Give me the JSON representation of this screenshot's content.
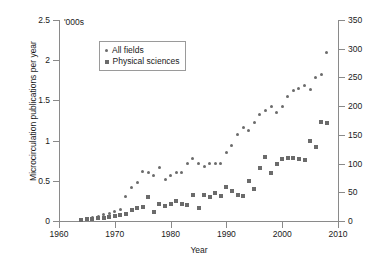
{
  "chart_data": {
    "type": "scatter",
    "title": "",
    "xlabel": "Year",
    "ylabel": "Microcirculation publications per year",
    "y_unit_note": "'000s",
    "xlim": [
      1960,
      2010
    ],
    "ylim_left": [
      0,
      2.5
    ],
    "ylim_right": [
      0,
      350
    ],
    "xticks": [
      1960,
      1970,
      1980,
      1990,
      2000,
      2010
    ],
    "yticks_left": [
      0,
      0.5,
      1,
      1.5,
      2,
      2.5
    ],
    "yticks_right": [
      0,
      50,
      100,
      150,
      200,
      250,
      300,
      350
    ],
    "grid": false,
    "legend_position": "upper-left-inside",
    "marker_color": "#6b6b6b",
    "axis_color": "#8a8a8a",
    "series": [
      {
        "name": "All fields",
        "marker": "circle",
        "axis": "left",
        "x": [
          1964,
          1965,
          1966,
          1967,
          1968,
          1969,
          1970,
          1971,
          1972,
          1973,
          1974,
          1975,
          1976,
          1977,
          1978,
          1979,
          1980,
          1981,
          1982,
          1983,
          1984,
          1985,
          1986,
          1987,
          1988,
          1989,
          1990,
          1991,
          1992,
          1993,
          1994,
          1995,
          1996,
          1997,
          1998,
          1999,
          2000,
          2001,
          2002,
          2003,
          2004,
          2005,
          2006,
          2007,
          2008
        ],
        "values": [
          0.02,
          0.03,
          0.04,
          0.06,
          0.08,
          0.09,
          0.12,
          0.14,
          0.3,
          0.42,
          0.48,
          0.62,
          0.6,
          0.56,
          0.67,
          0.52,
          0.57,
          0.6,
          0.6,
          0.72,
          0.78,
          0.72,
          0.68,
          0.72,
          0.71,
          0.72,
          0.85,
          0.94,
          1.08,
          1.16,
          1.12,
          1.22,
          1.32,
          1.38,
          1.42,
          1.35,
          1.43,
          1.55,
          1.62,
          1.65,
          1.68,
          1.63,
          1.78,
          1.82,
          2.1
        ]
      },
      {
        "name": "Physical sciences",
        "marker": "square",
        "axis": "right",
        "x": [
          1964,
          1965,
          1966,
          1967,
          1968,
          1969,
          1970,
          1971,
          1972,
          1973,
          1974,
          1975,
          1976,
          1977,
          1978,
          1979,
          1980,
          1981,
          1982,
          1983,
          1984,
          1985,
          1986,
          1987,
          1988,
          1989,
          1990,
          1991,
          1992,
          1993,
          1994,
          1995,
          1996,
          1997,
          1998,
          1999,
          2000,
          2001,
          2002,
          2003,
          2004,
          2005,
          2006,
          2007,
          2008
        ],
        "values": [
          2,
          3,
          4,
          5,
          6,
          7,
          8,
          10,
          12,
          20,
          22,
          24,
          42,
          16,
          30,
          26,
          30,
          34,
          30,
          28,
          46,
          22,
          46,
          42,
          48,
          44,
          60,
          52,
          46,
          44,
          70,
          56,
          92,
          112,
          84,
          100,
          108,
          110,
          110,
          108,
          106,
          140,
          128,
          172,
          170
        ]
      }
    ]
  },
  "legend": {
    "items": [
      {
        "label": "All fields"
      },
      {
        "label": "Physical sciences"
      }
    ]
  }
}
